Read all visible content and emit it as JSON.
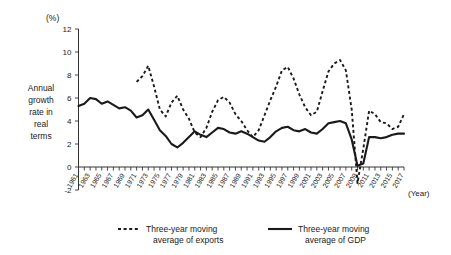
{
  "chart_data": {
    "type": "line",
    "title": "",
    "unit_label": "(%)",
    "ylabel": "Annual growth rate in real terms",
    "xlabel": "(Year)",
    "ylim": [
      -2,
      12
    ],
    "yticks": [
      -2,
      0,
      2,
      4,
      6,
      8,
      10,
      12
    ],
    "ytick_labels": [
      "-2",
      "0",
      "2",
      "4",
      "6",
      "8",
      "10",
      "12"
    ],
    "xlim": [
      1961,
      2017
    ],
    "grid": false,
    "legend_position": "below",
    "x": [
      1961,
      1962,
      1963,
      1964,
      1965,
      1966,
      1967,
      1968,
      1969,
      1970,
      1971,
      1972,
      1973,
      1974,
      1975,
      1976,
      1977,
      1978,
      1979,
      1980,
      1981,
      1982,
      1983,
      1984,
      1985,
      1986,
      1987,
      1988,
      1989,
      1990,
      1991,
      1992,
      1993,
      1994,
      1995,
      1996,
      1997,
      1998,
      1999,
      2000,
      2001,
      2002,
      2003,
      2004,
      2005,
      2006,
      2007,
      2008,
      2009,
      2010,
      2011,
      2012,
      2013,
      2014,
      2015,
      2016,
      2017
    ],
    "xtick_labels": [
      "1961",
      "1963",
      "1965",
      "1967",
      "1969",
      "1971",
      "1973",
      "1975",
      "1977",
      "1979",
      "1981",
      "1983",
      "1985",
      "1987",
      "1989",
      "1991",
      "1993",
      "1995",
      "1997",
      "1999",
      "2001",
      "2003",
      "2005",
      "2007",
      "2009",
      "2011",
      "2013",
      "2015",
      "2017"
    ],
    "series": [
      {
        "name": "Three-year moving average of exports",
        "style": "dashed",
        "color": "#1a1a1a",
        "values": [
          null,
          null,
          null,
          null,
          null,
          null,
          null,
          null,
          null,
          null,
          7.4,
          7.9,
          8.8,
          7.0,
          5.0,
          4.4,
          5.6,
          6.2,
          5.0,
          4.2,
          3.0,
          2.6,
          3.4,
          4.8,
          5.8,
          6.1,
          5.6,
          4.6,
          4.0,
          3.2,
          2.6,
          3.2,
          4.5,
          5.8,
          7.0,
          8.4,
          8.7,
          7.7,
          6.3,
          5.2,
          4.5,
          4.8,
          6.6,
          8.3,
          9.0,
          9.3,
          8.4,
          5.0,
          -1.4,
          1.6,
          4.9,
          4.6,
          3.9,
          3.8,
          3.3,
          3.5,
          4.6
        ]
      },
      {
        "name": "Three-year moving average of GDP",
        "style": "solid",
        "color": "#1a1a1a",
        "values": [
          5.3,
          5.5,
          6.0,
          5.9,
          5.5,
          5.7,
          5.4,
          5.1,
          5.2,
          4.9,
          4.3,
          4.5,
          5.0,
          4.1,
          3.2,
          2.7,
          2.0,
          1.7,
          2.1,
          2.6,
          3.1,
          2.8,
          2.6,
          3.0,
          3.4,
          3.3,
          3.0,
          2.9,
          3.1,
          2.9,
          2.6,
          2.3,
          2.2,
          2.6,
          3.1,
          3.4,
          3.5,
          3.2,
          3.1,
          3.3,
          3.0,
          2.9,
          3.3,
          3.8,
          3.9,
          4.0,
          3.8,
          2.4,
          0.1,
          0.3,
          2.6,
          2.6,
          2.5,
          2.6,
          2.8,
          2.9,
          2.9
        ]
      }
    ]
  },
  "legend": {
    "items": [
      {
        "label_line1": "Three-year moving",
        "label_line2": "average of exports",
        "style": "dashed"
      },
      {
        "label_line1": "Three-year moving",
        "label_line2": "average of GDP",
        "style": "solid"
      }
    ]
  },
  "ylabel_lines": [
    "Annual",
    "growth",
    "rate in",
    "real",
    "terms"
  ]
}
